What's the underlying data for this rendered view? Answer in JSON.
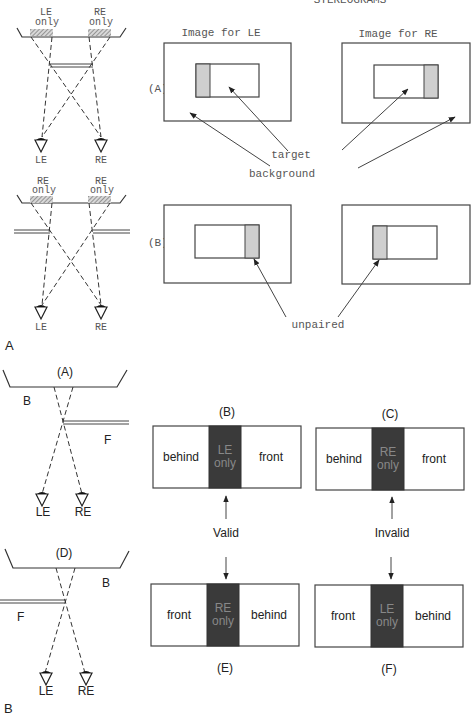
{
  "partA": {
    "header_title": "STEREOGRAMS",
    "panel_label": "A",
    "diagramA": {
      "label": "(A)",
      "region_left": [
        "LE",
        "only"
      ],
      "region_right": [
        "RE",
        "only"
      ],
      "eye_left": "LE",
      "eye_right": "RE"
    },
    "diagramB": {
      "label": "(B)",
      "region_left": [
        "RE",
        "only"
      ],
      "region_right": [
        "LE",
        "only"
      ],
      "eye_left": "LE",
      "eye_right": "RE"
    },
    "image_left_title": "Image for LE",
    "image_right_title": "Image for RE",
    "annotations": {
      "target": "target",
      "background": "background",
      "unpaired": "unpaired"
    }
  },
  "partB": {
    "panel_label": "B",
    "diagramA": {
      "label": "(A)",
      "surface": "B",
      "occluder": "F",
      "eye_left": "LE",
      "eye_right": "RE"
    },
    "diagramD": {
      "label": "(D)",
      "surface": "B",
      "occluder": "F",
      "eye_left": "LE",
      "eye_right": "RE"
    },
    "strips": [
      {
        "id": "B",
        "label": "(B)",
        "left": "behind",
        "middle": [
          "LE",
          "only"
        ],
        "right": "front"
      },
      {
        "id": "C",
        "label": "(C)",
        "left": "behind",
        "middle": [
          "RE",
          "only"
        ],
        "right": "front"
      },
      {
        "id": "E",
        "label": "(E)",
        "left": "front",
        "middle": [
          "RE",
          "only"
        ],
        "right": "behind"
      },
      {
        "id": "F",
        "label": "(F)",
        "left": "front",
        "middle": [
          "LE",
          "only"
        ],
        "right": "behind"
      }
    ],
    "verdict_left": "Valid",
    "verdict_right": "Invalid"
  }
}
